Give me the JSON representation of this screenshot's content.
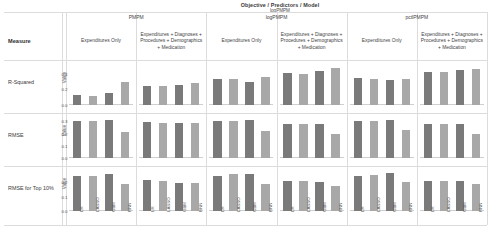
{
  "header": {
    "title": "Objective / Predictors / Model",
    "subtitle": "logPMPM",
    "measure_label": "Measure"
  },
  "objective_groups": [
    {
      "label": "PMPM"
    },
    {
      "label": "logPMPM"
    },
    {
      "label": "pctlPMPM"
    }
  ],
  "predictor_sets": [
    "Expenditures Only",
    "Expenditures + Diagnoses + Procedures + Demographics + Medication"
  ],
  "columns": [
    {
      "group": "PMPM",
      "predictors": "Expenditures Only"
    },
    {
      "group": "PMPM",
      "predictors": "Expenditures + Diagnoses + Procedures + Demographics + Medication"
    },
    {
      "group": "logPMPM",
      "predictors": "Expenditures Only"
    },
    {
      "group": "logPMPM",
      "predictors": "Expenditures + Diagnoses + Procedures + Demographics + Medication"
    },
    {
      "group": "pctlPMPM",
      "predictors": "Expenditures Only"
    },
    {
      "group": "pctlPMPM",
      "predictors": "Expenditures + Diagnoses + Procedures + Demographics + Medication"
    }
  ],
  "rows": [
    {
      "label": "R-Squared",
      "axis_title": "Value"
    },
    {
      "label": "RMSE",
      "axis_title": "Value"
    },
    {
      "label": "RMSE for Top 10%",
      "axis_title": "Value"
    }
  ],
  "models": [
    "LR",
    "LASSO",
    "GBM",
    "RNN"
  ],
  "colors": {
    "bar_dark": "#7a7a7a",
    "bar_light": "#a8a8a8",
    "grid": "#dcdcdc",
    "text": "#3a3a3a"
  },
  "chart_data": {
    "type": "bar",
    "title": "Objective / Predictors / Model",
    "subtitle": "logPMPM",
    "xlabel": "",
    "ylabel": "Value",
    "categories": [
      "LR",
      "LASSO",
      "GBM",
      "RNN"
    ],
    "grid": true,
    "legend": "none",
    "panels": [
      {
        "row": "R-Squared",
        "ylim": [
          0,
          0.5
        ],
        "yticks": [
          0.0,
          0.2,
          0.4
        ],
        "cells": [
          {
            "group": "PMPM",
            "predictors": "Expenditures Only",
            "values": [
              0.13,
              0.12,
              0.15,
              0.29
            ]
          },
          {
            "group": "PMPM",
            "predictors": "Expenditures + Diagnoses + Procedures + Demographics + Medication",
            "values": [
              0.24,
              0.24,
              0.26,
              0.28
            ]
          },
          {
            "group": "logPMPM",
            "predictors": "Expenditures Only",
            "values": [
              0.33,
              0.33,
              0.3,
              0.36
            ]
          },
          {
            "group": "logPMPM",
            "predictors": "Expenditures + Diagnoses + Procedures + Demographics + Medication",
            "values": [
              0.41,
              0.4,
              0.44,
              0.47
            ]
          },
          {
            "group": "pctlPMPM",
            "predictors": "Expenditures Only",
            "values": [
              0.34,
              0.33,
              0.32,
              0.33
            ]
          },
          {
            "group": "pctlPMPM",
            "predictors": "Expenditures + Diagnoses + Procedures + Demographics + Medication",
            "values": [
              0.42,
              0.42,
              0.45,
              0.46
            ]
          }
        ]
      },
      {
        "row": "RMSE",
        "ylim": [
          0,
          0.32
        ],
        "yticks": [
          0.0,
          0.1,
          0.2,
          0.3
        ],
        "cells": [
          {
            "group": "PMPM",
            "predictors": "Expenditures Only",
            "values": [
              0.3,
              0.3,
              0.31,
              0.21
            ]
          },
          {
            "group": "PMPM",
            "predictors": "Expenditures + Diagnoses + Procedures + Demographics + Medication",
            "values": [
              0.295,
              0.29,
              0.29,
              0.285
            ]
          },
          {
            "group": "logPMPM",
            "predictors": "Expenditures Only",
            "values": [
              0.3,
              0.3,
              0.315,
              0.22
            ]
          },
          {
            "group": "logPMPM",
            "predictors": "Expenditures + Diagnoses + Procedures + Demographics + Medication",
            "values": [
              0.28,
              0.28,
              0.275,
              0.2
            ]
          },
          {
            "group": "pctlPMPM",
            "predictors": "Expenditures Only",
            "values": [
              0.3,
              0.3,
              0.31,
              0.23
            ]
          },
          {
            "group": "pctlPMPM",
            "predictors": "Expenditures + Diagnoses + Procedures + Demographics + Medication",
            "values": [
              0.28,
              0.28,
              0.28,
              0.2
            ]
          }
        ]
      },
      {
        "row": "RMSE for Top 10%",
        "ylim": [
          0,
          0.27
        ],
        "yticks": [
          0.0,
          0.1,
          0.2
        ],
        "cells": [
          {
            "group": "PMPM",
            "predictors": "Expenditures Only",
            "values": [
              0.245,
              0.245,
              0.255,
              0.185
            ]
          },
          {
            "group": "PMPM",
            "predictors": "Expenditures + Diagnoses + Procedures + Demographics + Medication",
            "values": [
              0.215,
              0.205,
              0.195,
              0.195
            ]
          },
          {
            "group": "logPMPM",
            "predictors": "Expenditures Only",
            "values": [
              0.245,
              0.255,
              0.255,
              0.185
            ]
          },
          {
            "group": "logPMPM",
            "predictors": "Expenditures + Diagnoses + Procedures + Demographics + Medication",
            "values": [
              0.21,
              0.205,
              0.2,
              0.175
            ]
          },
          {
            "group": "pctlPMPM",
            "predictors": "Expenditures Only",
            "values": [
              0.245,
              0.25,
              0.26,
              0.2
            ]
          },
          {
            "group": "pctlPMPM",
            "predictors": "Expenditures + Diagnoses + Procedures + Demographics + Medication",
            "values": [
              0.205,
              0.205,
              0.21,
              0.19
            ]
          }
        ]
      }
    ]
  }
}
